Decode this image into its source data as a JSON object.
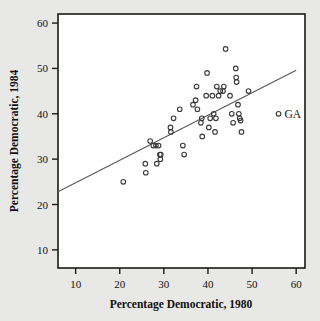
{
  "chart_data": {
    "type": "scatter",
    "title": "",
    "xlabel": "Percentage Democratic, 1980",
    "ylabel": "Percentage Democratic, 1984",
    "xlim": [
      6,
      62
    ],
    "ylim": [
      6,
      62
    ],
    "xticks": [
      10,
      20,
      30,
      40,
      50,
      60
    ],
    "yticks": [
      10,
      20,
      30,
      40,
      50,
      60
    ],
    "xtick_labels": [
      "10",
      "20",
      "30",
      "40",
      "50",
      "60"
    ],
    "ytick_labels": [
      "10",
      "20",
      "30",
      "40",
      "50",
      "60"
    ],
    "grid": false,
    "legend": "none",
    "marker": "open-circle",
    "points": [
      {
        "x": 20.8,
        "y": 25.0
      },
      {
        "x": 25.8,
        "y": 29.0
      },
      {
        "x": 25.9,
        "y": 27.0
      },
      {
        "x": 26.9,
        "y": 34.0
      },
      {
        "x": 27.6,
        "y": 33.0
      },
      {
        "x": 28.2,
        "y": 33.0
      },
      {
        "x": 28.4,
        "y": 29.0
      },
      {
        "x": 28.8,
        "y": 33.0
      },
      {
        "x": 29.1,
        "y": 31.0
      },
      {
        "x": 29.2,
        "y": 30.0
      },
      {
        "x": 29.3,
        "y": 31.0
      },
      {
        "x": 31.5,
        "y": 37.0
      },
      {
        "x": 31.6,
        "y": 36.0
      },
      {
        "x": 32.2,
        "y": 39.0
      },
      {
        "x": 33.6,
        "y": 41.0
      },
      {
        "x": 34.3,
        "y": 33.0
      },
      {
        "x": 34.6,
        "y": 31.0
      },
      {
        "x": 36.6,
        "y": 42.0
      },
      {
        "x": 37.2,
        "y": 43.0
      },
      {
        "x": 37.4,
        "y": 46.0
      },
      {
        "x": 37.6,
        "y": 41.0
      },
      {
        "x": 38.4,
        "y": 38.0
      },
      {
        "x": 38.6,
        "y": 39.0
      },
      {
        "x": 38.7,
        "y": 35.0
      },
      {
        "x": 39.6,
        "y": 44.0
      },
      {
        "x": 39.8,
        "y": 49.0
      },
      {
        "x": 40.2,
        "y": 37.0
      },
      {
        "x": 40.5,
        "y": 39.0
      },
      {
        "x": 41.0,
        "y": 44.0
      },
      {
        "x": 41.3,
        "y": 40.0
      },
      {
        "x": 41.6,
        "y": 36.0
      },
      {
        "x": 41.8,
        "y": 39.0
      },
      {
        "x": 42.0,
        "y": 46.0
      },
      {
        "x": 42.4,
        "y": 44.0
      },
      {
        "x": 42.8,
        "y": 45.0
      },
      {
        "x": 43.4,
        "y": 45.0
      },
      {
        "x": 43.6,
        "y": 46.0
      },
      {
        "x": 44.0,
        "y": 54.3
      },
      {
        "x": 45.0,
        "y": 44.0
      },
      {
        "x": 45.4,
        "y": 40.0
      },
      {
        "x": 45.7,
        "y": 38.0
      },
      {
        "x": 46.3,
        "y": 50.0
      },
      {
        "x": 46.4,
        "y": 48.0
      },
      {
        "x": 46.5,
        "y": 47.0
      },
      {
        "x": 46.8,
        "y": 42.0
      },
      {
        "x": 47.0,
        "y": 40.0
      },
      {
        "x": 47.2,
        "y": 39.0
      },
      {
        "x": 47.4,
        "y": 38.5
      },
      {
        "x": 47.6,
        "y": 36.0
      },
      {
        "x": 49.2,
        "y": 45.0
      },
      {
        "x": 56.0,
        "y": 40.0
      }
    ],
    "labeled_points": [
      {
        "label": "GA",
        "x": 56.0,
        "y": 40.0
      }
    ],
    "fit_line": {
      "type": "linear",
      "x_start": 6.0,
      "y_start": 22.8,
      "x_end": 60.0,
      "y_end": 49.6,
      "color": "#5a5a5a"
    }
  },
  "colors": {
    "background": "#e8e8e6",
    "plot_area": "#ffffff",
    "frame": "#1a1a1a",
    "marker_stroke": "#3b3b3b",
    "line": "#5a5a5a",
    "text": "#111111"
  }
}
